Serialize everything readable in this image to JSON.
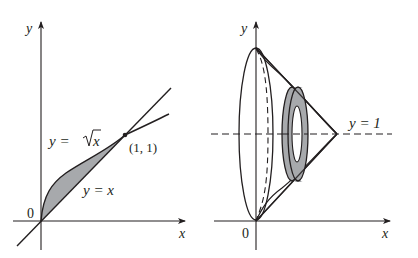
{
  "left_panel": {
    "x_axis_label": "x",
    "y_axis_label": "y",
    "origin_label": "0",
    "curve_label_sqrt_prefix": "y = ",
    "curve_label_sqrt_var": "x",
    "line_label": "y = x",
    "intersection_label": "(1, 1)",
    "region_fill": "#a7a9ac"
  },
  "right_panel": {
    "x_axis_label": "x",
    "y_axis_label": "y",
    "origin_label": "0",
    "axis_of_rotation_label": "y = 1",
    "washer_fill": "#a7a9ac"
  },
  "colors": {
    "stroke": "#231f20",
    "background": "#ffffff"
  }
}
